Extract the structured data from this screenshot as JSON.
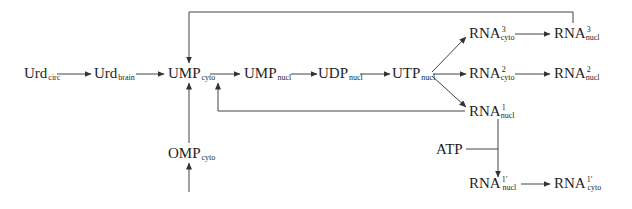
{
  "diagram": {
    "type": "metabolic-pathway",
    "nodes": {
      "urd_circ": {
        "main": "Urd",
        "sup": "",
        "sub": "circ"
      },
      "urd_brain": {
        "main": "Urd",
        "sup": "",
        "sub": "brain"
      },
      "ump_cyto": {
        "main": "UMP",
        "sup": "",
        "sub": "cyto"
      },
      "ump_nucl": {
        "main": "UMP",
        "sup": "",
        "sub": "nucl"
      },
      "udp_nucl": {
        "main": "UDP",
        "sup": "",
        "sub": "nucl"
      },
      "utp_nucl": {
        "main": "UTP",
        "sup": "",
        "sub": "nucl"
      },
      "rna3_cyto": {
        "main": "RNA",
        "sup": "3",
        "sub": "cyto"
      },
      "rna3_nucl": {
        "main": "RNA",
        "sup": "3",
        "sub": "nucl"
      },
      "rna2_cyto": {
        "main": "RNA",
        "sup": "2",
        "sub": "cyto"
      },
      "rna2_nucl": {
        "main": "RNA",
        "sup": "2",
        "sub": "nucl"
      },
      "rna1_nucl": {
        "main": "RNA",
        "sup": "1",
        "sub": "nucl"
      },
      "omp_cyto": {
        "main": "OMP",
        "sup": "",
        "sub": "cyto"
      },
      "atp": {
        "main": "ATP",
        "sup": "",
        "sub": ""
      },
      "rna1p_nucl": {
        "main": "RNA",
        "sup": "1′",
        "sub": "nucl"
      },
      "rna1p_cyto": {
        "main": "RNA",
        "sup": "1′",
        "sub": "cyto"
      }
    },
    "edges": [
      [
        "urd_circ",
        "urd_brain"
      ],
      [
        "urd_brain",
        "ump_cyto"
      ],
      [
        "ump_cyto",
        "ump_nucl"
      ],
      [
        "ump_nucl",
        "udp_nucl"
      ],
      [
        "udp_nucl",
        "utp_nucl"
      ],
      [
        "utp_nucl",
        "rna3_cyto"
      ],
      [
        "utp_nucl",
        "rna2_cyto"
      ],
      [
        "utp_nucl",
        "rna1_nucl"
      ],
      [
        "rna3_cyto",
        "rna3_nucl"
      ],
      [
        "rna2_cyto",
        "rna2_nucl"
      ],
      [
        "rna3_nucl",
        "ump_cyto"
      ],
      [
        "rna1_nucl",
        "ump_nucl"
      ],
      [
        "omp_cyto",
        "ump_cyto"
      ],
      [
        "input",
        "omp_cyto"
      ],
      [
        "rna1_nucl",
        "rna1p_nucl"
      ],
      [
        "atp",
        "rna1p_nucl"
      ],
      [
        "rna1p_nucl",
        "rna1p_cyto"
      ]
    ]
  }
}
